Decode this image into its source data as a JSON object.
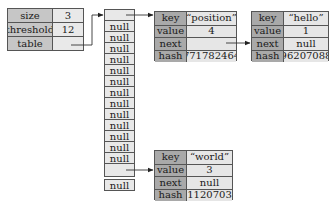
{
  "map": {
    "rows": [
      {
        "label": "size",
        "value": "3"
      },
      {
        "label": "threshold",
        "value": "12"
      },
      {
        "label": "table",
        "value": ""
      }
    ]
  },
  "table": {
    "slots": [
      "",
      "null",
      "null",
      "null",
      "null",
      "null",
      "null",
      "null",
      "null",
      "null",
      "null",
      "null",
      "null",
      "null",
      "",
      "null"
    ]
  },
  "nodes": {
    "position": {
      "rows": [
        {
          "label": "key",
          "value": "“position”"
        },
        {
          "label": "value",
          "value": "4"
        },
        {
          "label": "next",
          "value": ""
        },
        {
          "label": "hash",
          "value": "771782464"
        }
      ]
    },
    "hello": {
      "rows": [
        {
          "label": "key",
          "value": "“hello”"
        },
        {
          "label": "value",
          "value": "1"
        },
        {
          "label": "next",
          "value": "null"
        },
        {
          "label": "hash",
          "value": "96207088"
        }
      ]
    },
    "world": {
      "rows": [
        {
          "label": "key",
          "value": "“world”"
        },
        {
          "label": "value",
          "value": "3"
        },
        {
          "label": "next",
          "value": "null"
        },
        {
          "label": "hash",
          "value": "111207038"
        }
      ]
    }
  },
  "colors": {
    "map_label_bg": "#c6c6c6",
    "node_label_bg": "#a9a9a9",
    "value_bg": "#e8e8e8",
    "border": "#555555"
  }
}
